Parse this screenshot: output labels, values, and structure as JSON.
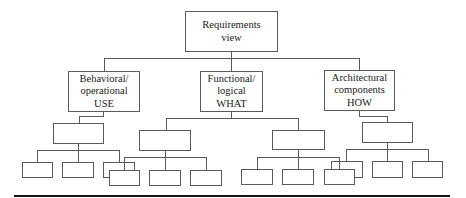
{
  "diagram": {
    "type": "hierarchy-tree",
    "root": {
      "label_lines": [
        "Requirements",
        "view"
      ]
    },
    "branches": [
      {
        "label_lines": [
          "Behavioral/",
          "operational",
          "USE"
        ],
        "children": [
          {
            "label": "",
            "children": [
              {
                "label": ""
              },
              {
                "label": ""
              },
              {
                "label": ""
              }
            ]
          }
        ]
      },
      {
        "label_lines": [
          "Functional/",
          "logical",
          "WHAT"
        ],
        "children": [
          {
            "label": "",
            "children": [
              {
                "label": ""
              },
              {
                "label": ""
              },
              {
                "label": ""
              }
            ]
          },
          {
            "label": "",
            "children": [
              {
                "label": ""
              },
              {
                "label": ""
              },
              {
                "label": ""
              }
            ]
          }
        ]
      },
      {
        "label_lines": [
          "Architectural",
          "components",
          "HOW"
        ],
        "children": [
          {
            "label": "",
            "children": [
              {
                "label": ""
              },
              {
                "label": ""
              },
              {
                "label": ""
              }
            ]
          }
        ]
      }
    ],
    "colors": {
      "line": "#5a5a5a",
      "text": "#222222",
      "rule": "#111111",
      "background": "#ffffff"
    }
  }
}
